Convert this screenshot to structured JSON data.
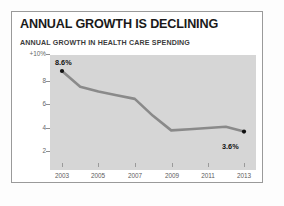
{
  "figure": {
    "title": "ANNUAL GROWTH IS DECLINING",
    "subtitle": "ANNUAL GROWTH IN HEALTH CARE SPENDING"
  },
  "colors": {
    "plot_background": "#d6d6d6",
    "line": "#8a8a8a",
    "marker": "#111111",
    "card_border": "#9a9a9a",
    "title_text": "#1a1a1a",
    "tick_text": "#5c5c5c"
  },
  "axis": {
    "y_ticks": [
      "+10%",
      "8",
      "6",
      "4",
      "2"
    ],
    "x_ticks": [
      "2003",
      "2005",
      "2007",
      "2009",
      "2011",
      "2013"
    ]
  },
  "annotations": {
    "start_label": "8.6%",
    "end_label": "3.6%"
  },
  "chart_data": {
    "type": "line",
    "title": "ANNUAL GROWTH IS DECLINING",
    "subtitle": "ANNUAL GROWTH IN HEALTH CARE SPENDING",
    "xlabel": "",
    "ylabel": "",
    "x": [
      2003,
      2004,
      2005,
      2006,
      2007,
      2008,
      2009,
      2010,
      2011,
      2012,
      2013
    ],
    "values": [
      8.6,
      7.3,
      6.9,
      6.6,
      6.3,
      4.9,
      3.7,
      3.8,
      3.9,
      4.0,
      3.6
    ],
    "series": [
      {
        "name": "Annual growth in health care spending",
        "values": [
          8.6,
          7.3,
          6.9,
          6.6,
          6.3,
          4.9,
          3.7,
          3.8,
          3.9,
          4.0,
          3.6
        ]
      }
    ],
    "xlim": [
      2002.0,
      2013.9
    ],
    "ylim": [
      0,
      10
    ],
    "ytick_values": [
      10,
      8,
      6,
      4,
      2
    ],
    "ytick_labels": [
      "+10%",
      "8",
      "6",
      "4",
      "2"
    ],
    "xtick_values": [
      2003,
      2005,
      2007,
      2009,
      2011,
      2013
    ],
    "xtick_labels": [
      "2003",
      "2005",
      "2007",
      "2009",
      "2011",
      "2013"
    ],
    "grid": false,
    "legend": "none",
    "markers": [
      {
        "x": 2003,
        "y": 8.6,
        "label": "8.6%"
      },
      {
        "x": 2013,
        "y": 3.6,
        "label": "3.6%"
      }
    ],
    "annotations": [
      "8.6%",
      "3.6%"
    ]
  }
}
